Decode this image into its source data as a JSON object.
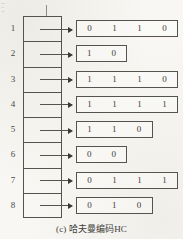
{
  "figure": {
    "caption": "(c) 哈夫曼编码HC",
    "column_tick": "|",
    "ink_color": "#55534e",
    "text_color": "#3e3c38",
    "background_color": "#f8f7f3"
  },
  "rows": [
    {
      "index": "1",
      "bits": [
        "0",
        "1",
        "1",
        "0"
      ]
    },
    {
      "index": "2",
      "bits": [
        "1",
        "0"
      ]
    },
    {
      "index": "3",
      "bits": [
        "1",
        "1",
        "1",
        "0"
      ]
    },
    {
      "index": "4",
      "bits": [
        "1",
        "1",
        "1",
        "1"
      ]
    },
    {
      "index": "5",
      "bits": [
        "1",
        "1",
        "0"
      ]
    },
    {
      "index": "6",
      "bits": [
        "0",
        "0"
      ]
    },
    {
      "index": "7",
      "bits": [
        "0",
        "1",
        "1",
        "1"
      ]
    },
    {
      "index": "8",
      "bits": [
        "0",
        "1",
        "0"
      ]
    }
  ]
}
